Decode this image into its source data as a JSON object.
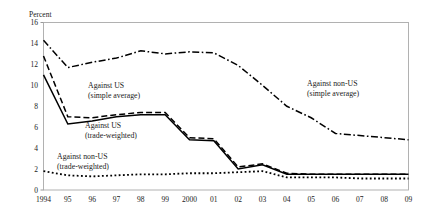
{
  "chart_data": {
    "type": "line",
    "title": "",
    "xlabel": "",
    "ylabel": "Percent",
    "ylim": [
      0,
      16
    ],
    "yticks": [
      0,
      2,
      4,
      6,
      8,
      10,
      12,
      14,
      16
    ],
    "ytick_labels": [
      "0",
      "2",
      "4",
      "6",
      "8",
      "10",
      "12",
      "14",
      "16"
    ],
    "grid": false,
    "legend_position": "inline-annotations",
    "x": [
      1994,
      1995,
      1996,
      1997,
      1998,
      1999,
      2000,
      2001,
      2002,
      2003,
      2004,
      2005,
      2006,
      2007,
      2008,
      2009
    ],
    "xtick_labels": [
      "1994",
      "95",
      "96",
      "97",
      "98",
      "99",
      "2000",
      "01",
      "02",
      "03",
      "04",
      "05",
      "06",
      "07",
      "08",
      "09"
    ],
    "series": [
      {
        "name": "Against non-US (simple average)",
        "style": "dash-dot",
        "values": [
          14.3,
          11.7,
          12.2,
          12.6,
          13.3,
          13.0,
          13.2,
          13.1,
          11.9,
          10.0,
          8.0,
          6.9,
          5.4,
          5.2,
          5.0,
          4.8
        ]
      },
      {
        "name": "Against US (simple average)",
        "style": "dashed",
        "values": [
          12.8,
          7.0,
          6.9,
          7.2,
          7.4,
          7.4,
          5.0,
          4.9,
          2.2,
          2.5,
          1.6,
          1.5,
          1.5,
          1.5,
          1.5,
          1.5
        ]
      },
      {
        "name": "Against US (trade-weighted)",
        "style": "solid",
        "values": [
          11.0,
          6.3,
          6.6,
          7.0,
          7.2,
          7.2,
          4.8,
          4.7,
          2.0,
          2.4,
          1.5,
          1.5,
          1.5,
          1.5,
          1.5,
          1.5
        ]
      },
      {
        "name": "Against non-US (trade-weighted)",
        "style": "dotted",
        "values": [
          1.8,
          1.4,
          1.3,
          1.4,
          1.5,
          1.5,
          1.6,
          1.6,
          1.7,
          1.8,
          1.2,
          1.2,
          1.2,
          1.1,
          1.1,
          1.1
        ]
      }
    ],
    "annotations": [
      {
        "id": "against-us-simple",
        "line1": "Against US",
        "line2": "(simple average)",
        "x": 88,
        "y": 88
      },
      {
        "id": "against-us-trade-weighted",
        "line1": "Against US",
        "line2": "(trade-weighted)",
        "x": 85,
        "y": 128
      },
      {
        "id": "against-non-us-trade-weighted",
        "line1": "Against non-US",
        "line2": "(trade-weighted)",
        "x": 57,
        "y": 159
      },
      {
        "id": "against-non-us-simple",
        "line1": "Against non-US",
        "line2": "(simple average)",
        "x": 307,
        "y": 86
      }
    ]
  },
  "axis": {
    "y_title": "Percent"
  },
  "colors": {
    "line": "#000000",
    "frame": "#a9a9a9",
    "text": "#1a1a1a",
    "background": "#ffffff"
  }
}
